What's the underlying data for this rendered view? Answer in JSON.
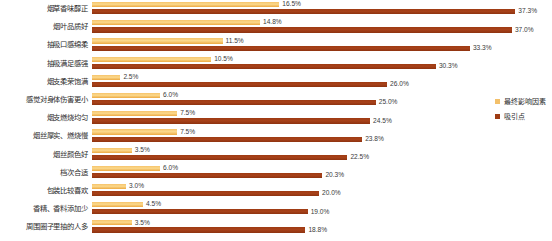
{
  "chart_data": {
    "type": "bar",
    "orientation": "horizontal",
    "title": "",
    "subtitle": "",
    "xlabel": "",
    "ylabel": "",
    "grid": false,
    "legend_position": "right",
    "xlim": [
      0,
      40
    ],
    "value_suffix": "%",
    "categories": [
      "烟草香味醇正",
      "烟叶品质好",
      "抽吸口感绵柔",
      "抽吸满足感强",
      "烟支柔荣饱满",
      "感觉对身体伤害更小",
      "烟支燃烧均匀",
      "烟丝厚实、燃烧慢",
      "烟丝颜色好",
      "档次合适",
      "包装比较喜欢",
      "香精、香料添加少",
      "周围圈子里抽的人多"
    ],
    "series": [
      {
        "name": "最终影响因素",
        "color": "#f3c06a",
        "values": [
          16.5,
          14.8,
          11.5,
          10.5,
          2.5,
          6.0,
          7.5,
          7.5,
          3.5,
          6.0,
          3.0,
          4.5,
          3.5
        ],
        "labels": [
          "16.5%",
          "14.8%",
          "11.5%",
          "10.5%",
          "2.5%",
          "6.0%",
          "7.5%",
          "7.5%",
          "3.5%",
          "6.0%",
          "3.0%",
          "4.5%",
          "3.5%"
        ]
      },
      {
        "name": "吸引点",
        "color": "#9e3b13",
        "values": [
          37.3,
          37.0,
          33.3,
          30.3,
          26.0,
          25.0,
          24.5,
          23.8,
          22.5,
          20.3,
          20.0,
          19.0,
          18.8
        ],
        "labels": [
          "37.3%",
          "37.0%",
          "33.3%",
          "30.3%",
          "26.0%",
          "25.0%",
          "24.5%",
          "23.8%",
          "22.5%",
          "20.3%",
          "20.0%",
          "19.0%",
          "18.8%"
        ]
      }
    ]
  },
  "legend": {
    "items": [
      {
        "label": "最终影响因素"
      },
      {
        "label": "吸引点"
      }
    ]
  }
}
